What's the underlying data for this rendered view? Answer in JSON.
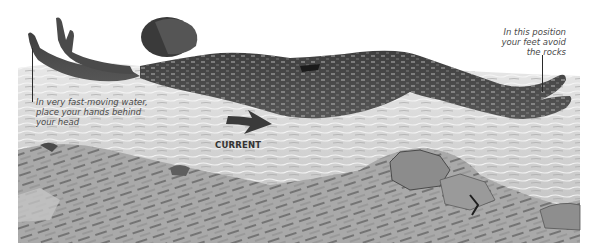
{
  "figure": {
    "annotations": {
      "hands": {
        "lines": [
          "In very fast-moving water,",
          "place your hands behind",
          "your head"
        ]
      },
      "feet": {
        "lines": [
          "In this position",
          "your feet avoid",
          "the rocks"
        ]
      },
      "current": {
        "label": "CURRENT",
        "icon": "arrow-right-icon"
      }
    },
    "colors": {
      "background": "#ffffff",
      "water_light": "#d9d9d9",
      "water_mid": "#b8b8b8",
      "rocks_dark": "#6e6e6e",
      "body": "#4b4b4b",
      "text": "#4a4a4a"
    }
  }
}
